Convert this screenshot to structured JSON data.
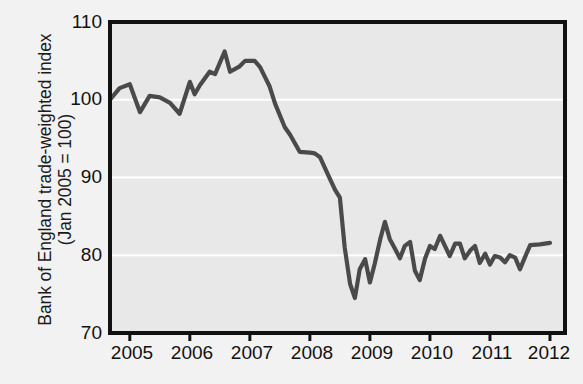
{
  "figure": {
    "background_color": "#f2f2f2",
    "plot_background_color": "#e8e8e8",
    "gridline_color": "#ffffff",
    "axis_color": "#111111",
    "line_color": "#4a4a4a"
  },
  "axes": {
    "ylabel_line1": "Bank of England trade-weighted index",
    "ylabel_line2": "(Jan 2005 = 100)",
    "yticks": [
      "70",
      "80",
      "90",
      "100",
      "110"
    ],
    "xticks": [
      "2005",
      "2006",
      "2007",
      "2008",
      "2009",
      "2010",
      "2011",
      "2012"
    ]
  },
  "chart_data": {
    "type": "line",
    "title": "",
    "xlabel": "",
    "ylabel": "Bank of England trade-weighted index (Jan 2005 = 100)",
    "xlim": [
      2004.67,
      2012.25
    ],
    "ylim": [
      70,
      110
    ],
    "yticks": [
      70,
      80,
      90,
      100,
      110
    ],
    "xticks": [
      2005,
      2006,
      2007,
      2008,
      2009,
      2010,
      2011,
      2012
    ],
    "grid": "horizontal gridlines at 80, 90, 100 (white)",
    "legend": "none",
    "series": [
      {
        "name": "Bank of England trade-weighted sterling index",
        "color": "#4a4a4a",
        "x": [
          2004.67,
          2004.83,
          2005.0,
          2005.17,
          2005.33,
          2005.5,
          2005.67,
          2005.83,
          2006.0,
          2006.08,
          2006.17,
          2006.33,
          2006.42,
          2006.58,
          2006.67,
          2006.83,
          2006.92,
          2007.08,
          2007.17,
          2007.33,
          2007.42,
          2007.58,
          2007.67,
          2007.83,
          2008.0,
          2008.08,
          2008.17,
          2008.33,
          2008.42,
          2008.5,
          2008.58,
          2008.67,
          2008.75,
          2008.83,
          2008.92,
          2009.0,
          2009.08,
          2009.17,
          2009.25,
          2009.33,
          2009.42,
          2009.5,
          2009.58,
          2009.67,
          2009.75,
          2009.83,
          2009.92,
          2010.0,
          2010.08,
          2010.17,
          2010.25,
          2010.33,
          2010.42,
          2010.5,
          2010.58,
          2010.67,
          2010.75,
          2010.83,
          2010.92,
          2011.0,
          2011.08,
          2011.17,
          2011.25,
          2011.33,
          2011.42,
          2011.5,
          2011.58,
          2011.67,
          2011.83,
          2012.0
        ],
        "y": [
          100.0,
          101.5,
          102.0,
          98.4,
          100.5,
          100.3,
          99.6,
          98.2,
          102.3,
          100.7,
          101.9,
          103.6,
          103.3,
          106.2,
          103.6,
          104.3,
          105.0,
          105.0,
          104.2,
          101.7,
          99.5,
          96.5,
          95.5,
          93.3,
          93.2,
          93.1,
          92.6,
          89.9,
          88.4,
          87.4,
          81.0,
          76.3,
          74.5,
          78.2,
          79.5,
          76.5,
          78.9,
          82.0,
          84.3,
          82.1,
          80.8,
          79.6,
          81.2,
          81.7,
          78.0,
          76.8,
          79.6,
          81.2,
          80.8,
          82.5,
          81.2,
          79.9,
          81.5,
          81.5,
          79.6,
          80.6,
          81.2,
          79.0,
          80.2,
          78.8,
          79.9,
          79.7,
          79.1,
          80.0,
          79.7,
          78.2,
          79.7,
          81.3,
          81.4,
          81.6
        ]
      }
    ]
  }
}
